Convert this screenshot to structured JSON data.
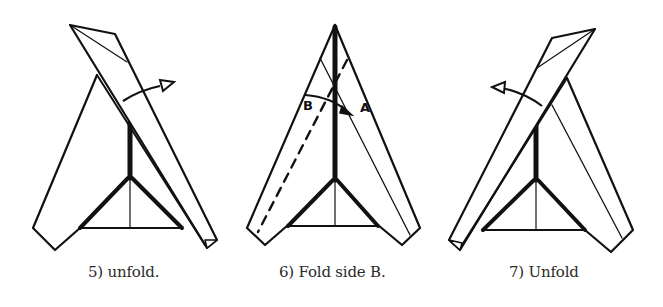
{
  "figure": {
    "colors": {
      "line": "#111111",
      "background": "#ffffff",
      "caption": "#2a2a2a"
    }
  },
  "steps": [
    {
      "number": 5,
      "caption": "5) unfold.",
      "arrow_direction": "right",
      "fold_state": "right flap folded across to left"
    },
    {
      "number": 6,
      "caption": "6) Fold side B.",
      "labels": [
        "B",
        "A"
      ],
      "arrow_direction": "B to A",
      "fold_line": "dashed"
    },
    {
      "number": 7,
      "caption": "7) Unfold",
      "arrow_direction": "left",
      "fold_state": "left flap folded across to right"
    }
  ]
}
